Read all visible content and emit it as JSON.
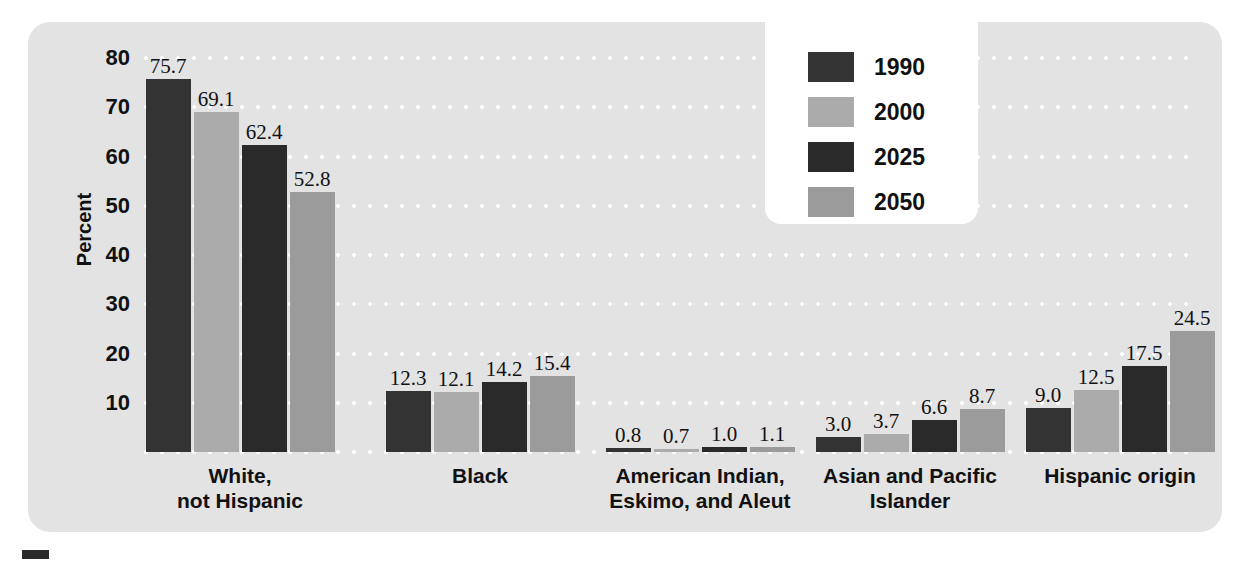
{
  "chart_data": {
    "type": "bar",
    "title": "",
    "subtitle": "",
    "xlabel": "",
    "ylabel": "Percent",
    "ylim": [
      0,
      80
    ],
    "ytick_values": [
      80,
      70,
      60,
      50,
      40,
      30,
      20,
      10
    ],
    "ytick_labels": [
      "80",
      "70",
      "60",
      "50",
      "40",
      "30",
      "20",
      "10"
    ],
    "grid": "horizontal dotted white gridlines at every 10 percent",
    "legend_position": "top-center-right",
    "categories": [
      "White,\nnot Hispanic",
      "Black",
      "American Indian,\nEskimo, and Aleut",
      "Asian and Pacific\nIslander",
      "Hispanic origin"
    ],
    "series": [
      {
        "name": "1990",
        "color": "#333333",
        "values": [
          75.7,
          12.3,
          0.8,
          3.0,
          9.0
        ],
        "labels": [
          "75.7",
          "12.3",
          "0.8",
          "3.0",
          "9.0"
        ]
      },
      {
        "name": "2000",
        "color": "#ababab",
        "values": [
          69.1,
          12.1,
          0.7,
          3.7,
          12.5
        ],
        "labels": [
          "69.1",
          "12.1",
          "0.7",
          "3.7",
          "12.5"
        ]
      },
      {
        "name": "2025",
        "color": "#2a2a2a",
        "values": [
          62.4,
          14.2,
          1.0,
          6.6,
          17.5
        ],
        "labels": [
          "62.4",
          "14.2",
          "1.0",
          "6.6",
          "17.5"
        ]
      },
      {
        "name": "2050",
        "color": "#9b9b9b",
        "values": [
          52.8,
          15.4,
          1.1,
          8.7,
          24.5
        ],
        "labels": [
          "52.8",
          "15.4",
          "1.1",
          "8.7",
          "24.5"
        ]
      }
    ]
  },
  "legend": {
    "items": [
      {
        "label": "1990",
        "color": "#333333"
      },
      {
        "label": "2000",
        "color": "#ababab"
      },
      {
        "label": "2025",
        "color": "#2a2a2a"
      },
      {
        "label": "2050",
        "color": "#9b9b9b"
      }
    ]
  },
  "axis": {
    "y_title": "Percent"
  },
  "colors": {
    "panel_background": "#e3e3e3",
    "gridline": "#ffffff",
    "text": "#111111",
    "legend_background": "#ffffff"
  }
}
